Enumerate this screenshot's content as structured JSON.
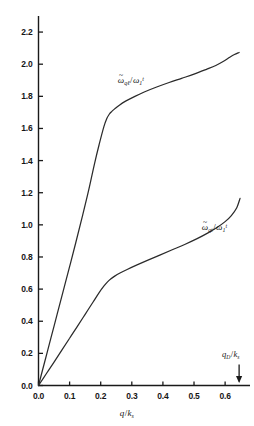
{
  "chart_data": {
    "type": "line",
    "title": "",
    "xlabel": "q/k_s",
    "ylabel": "",
    "xlim": [
      0.0,
      0.68
    ],
    "ylim": [
      0.0,
      2.3
    ],
    "grid": false,
    "legend_position": "inline-annotation",
    "xticks": [
      "0.0",
      "0.1",
      "0.2",
      "0.3",
      "0.4",
      "0.5",
      "0.6"
    ],
    "xtick_values": [
      0.0,
      0.1,
      0.2,
      0.3,
      0.4,
      0.5,
      0.6
    ],
    "yticks": [
      "0.0",
      "0.2",
      "0.4",
      "0.6",
      "0.8",
      "1.0",
      "1.2",
      "1.4",
      "1.6",
      "1.8",
      "2.0",
      "2.2"
    ],
    "ytick_values": [
      0.0,
      0.2,
      0.4,
      0.6,
      0.8,
      1.0,
      1.2,
      1.4,
      1.6,
      1.8,
      2.0,
      2.2
    ],
    "series": [
      {
        "name": "longitudinal",
        "label_plain": "w~_ql / w_1^t",
        "x": [
          0.0,
          0.02,
          0.04,
          0.06,
          0.08,
          0.1,
          0.12,
          0.14,
          0.16,
          0.18,
          0.195,
          0.21,
          0.22,
          0.228,
          0.235,
          0.245,
          0.26,
          0.28,
          0.31,
          0.34,
          0.38,
          0.42,
          0.46,
          0.5,
          0.54,
          0.57,
          0.595,
          0.615,
          0.63,
          0.645
        ],
        "y": [
          0.0,
          0.148,
          0.296,
          0.444,
          0.592,
          0.74,
          0.89,
          1.045,
          1.205,
          1.38,
          1.5,
          1.61,
          1.663,
          1.69,
          1.705,
          1.722,
          1.745,
          1.77,
          1.8,
          1.827,
          1.858,
          1.886,
          1.912,
          1.938,
          1.968,
          1.992,
          2.018,
          2.043,
          2.06,
          2.073
        ]
      },
      {
        "name": "transverse",
        "label_plain": "w~_qt / w_1^t",
        "x": [
          0.0,
          0.025,
          0.05,
          0.075,
          0.1,
          0.125,
          0.15,
          0.175,
          0.195,
          0.21,
          0.222,
          0.232,
          0.245,
          0.262,
          0.285,
          0.315,
          0.35,
          0.39,
          0.43,
          0.47,
          0.51,
          0.545,
          0.575,
          0.6,
          0.62,
          0.637,
          0.648
        ],
        "y": [
          0.0,
          0.073,
          0.146,
          0.22,
          0.294,
          0.368,
          0.443,
          0.518,
          0.578,
          0.618,
          0.645,
          0.663,
          0.681,
          0.7,
          0.722,
          0.749,
          0.779,
          0.812,
          0.845,
          0.878,
          0.914,
          0.95,
          0.985,
          1.02,
          1.058,
          1.105,
          1.165
        ]
      }
    ],
    "annotations": [
      {
        "name": "debye-cutoff-arrow",
        "label_plain": "q_D/k_s",
        "x_value": 0.645,
        "marker": "down-arrow"
      }
    ]
  },
  "axes": {
    "x_title": {
      "base": "q",
      "slash": "/",
      "sym": "k",
      "sub": "s"
    },
    "x_tick_labels": [
      "0.0",
      "0.1",
      "0.2",
      "0.3",
      "0.4",
      "0.5",
      "0.6"
    ],
    "y_tick_labels": [
      "0.0",
      "0.2",
      "0.4",
      "0.6",
      "0.8",
      "1.0",
      "1.2",
      "1.4",
      "1.6",
      "1.8",
      "2.0",
      "2.2"
    ]
  },
  "curve_labels": {
    "longitudinal": {
      "omega": "ω",
      "tilde": "~",
      "sub": "qℓ",
      "slash": "/",
      "omega2": "ω",
      "sub2": "1",
      "sup2": "t"
    },
    "transverse": {
      "omega": "ω",
      "tilde": "~",
      "sub": "qt",
      "slash": "/",
      "omega2": "ω",
      "sub2": "1",
      "sup2": "t"
    }
  },
  "annotation": {
    "debye": {
      "q": "q",
      "sub": "D",
      "slash": "/",
      "k": "k",
      "sub2": "s"
    }
  },
  "style": {
    "curve_color": "#2b2b2b",
    "axis_color": "#1a1a1a",
    "background": "#ffffff"
  }
}
